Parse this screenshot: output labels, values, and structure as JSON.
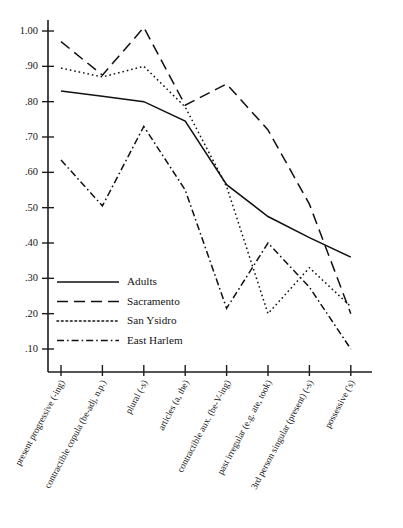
{
  "chart_data": {
    "type": "line",
    "title": "",
    "xlabel": "",
    "ylabel": "",
    "ylim": [
      0.05,
      1.05
    ],
    "grid": false,
    "legend_position": "inside-lower-left",
    "categories": [
      "present progressive (-ing)",
      "contractible copula (be-adj, n.p.)",
      "plural (-s)",
      "articles (a, the)",
      "contractible aux. (be-V-ing)",
      "past irregular (e.g. ate, took)",
      "3rd person singular (present) (-s)",
      "possessive ('s)"
    ],
    "ytick_labels": [
      "1.00",
      ".90",
      ".80",
      ".70",
      ".60",
      ".50",
      ".40",
      ".30",
      ".20",
      ".10"
    ],
    "ytick_values": [
      1.0,
      0.9,
      0.8,
      0.7,
      0.6,
      0.5,
      0.4,
      0.3,
      0.2,
      0.1
    ],
    "series": [
      {
        "name": "Adults",
        "style": "solid",
        "values": [
          0.83,
          0.815,
          0.8,
          0.745,
          0.565,
          0.475,
          0.415,
          0.36
        ]
      },
      {
        "name": "Sacramento",
        "style": "dashed",
        "values": [
          0.97,
          0.875,
          1.01,
          0.79,
          0.85,
          0.72,
          0.51,
          0.2
        ]
      },
      {
        "name": "San Ysidro",
        "style": "dotted",
        "values": [
          0.895,
          0.87,
          0.9,
          0.785,
          0.56,
          0.2,
          0.33,
          0.22
        ]
      },
      {
        "name": "East Harlem",
        "style": "dash-dot",
        "values": [
          0.635,
          0.505,
          0.73,
          0.55,
          0.215,
          0.4,
          0.275,
          0.1
        ]
      }
    ]
  },
  "legend": {
    "entries": [
      {
        "label": "Adults",
        "style": "solid"
      },
      {
        "label": "Sacramento",
        "style": "dashed"
      },
      {
        "label": "San Ysidro",
        "style": "dotted"
      },
      {
        "label": "East Harlem",
        "style": "dash-dot"
      }
    ]
  },
  "colors": {
    "ink": "#111111",
    "background": "#ffffff"
  }
}
